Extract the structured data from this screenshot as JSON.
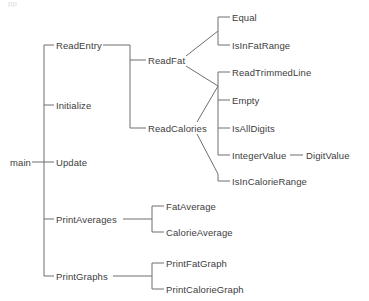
{
  "diagram": {
    "type": "call-tree",
    "title_fragment": "pp",
    "colors": {
      "line": "#6f6f6f",
      "text": "#3d3d3d",
      "background": "#ffffff"
    },
    "root": {
      "label": "main",
      "x": 10,
      "y": 162
    },
    "levels": {
      "level1_spine_x": 44,
      "level2_spine_x": 130,
      "level3_spine_x": 218,
      "averages_spine_x": 152
    },
    "nodes": [
      {
        "id": "main",
        "label": "main",
        "x": 10,
        "y": 162,
        "level": 0
      },
      {
        "id": "ReadEntry",
        "label": "ReadEntry",
        "x": 56,
        "y": 45,
        "level": 1
      },
      {
        "id": "Initialize",
        "label": "Initialize",
        "x": 56,
        "y": 105,
        "level": 1
      },
      {
        "id": "Update",
        "label": "Update",
        "x": 56,
        "y": 162,
        "level": 1
      },
      {
        "id": "PrintAverages",
        "label": "PrintAverages",
        "x": 56,
        "y": 219,
        "level": 1
      },
      {
        "id": "PrintGraphs",
        "label": "PrintGraphs",
        "x": 56,
        "y": 276,
        "level": 1
      },
      {
        "id": "ReadFat",
        "label": "ReadFat",
        "x": 148,
        "y": 60,
        "level": 2
      },
      {
        "id": "ReadCalories",
        "label": "ReadCalories",
        "x": 148,
        "y": 128,
        "level": 2
      },
      {
        "id": "FatAverage",
        "label": "FatAverage",
        "x": 166,
        "y": 206,
        "level": 2
      },
      {
        "id": "CalorieAverage",
        "label": "CalorieAverage",
        "x": 166,
        "y": 232,
        "level": 2
      },
      {
        "id": "PrintFatGraph",
        "label": "PrintFatGraph",
        "x": 166,
        "y": 263,
        "level": 2
      },
      {
        "id": "PrintCalorieGraph",
        "label": "PrintCalorieGraph",
        "x": 166,
        "y": 289,
        "level": 2
      },
      {
        "id": "Equal",
        "label": "Equal",
        "x": 232,
        "y": 17,
        "level": 3
      },
      {
        "id": "IsInFatRange",
        "label": "IsInFatRange",
        "x": 232,
        "y": 45,
        "level": 3
      },
      {
        "id": "ReadTrimmedLine",
        "label": "ReadTrimmedLine",
        "x": 232,
        "y": 72,
        "level": 3
      },
      {
        "id": "Empty",
        "label": "Empty",
        "x": 232,
        "y": 100,
        "level": 3
      },
      {
        "id": "IsAllDigits",
        "label": "IsAllDigits",
        "x": 232,
        "y": 128,
        "level": 3
      },
      {
        "id": "IntegerValue",
        "label": "IntegerValue",
        "x": 232,
        "y": 155,
        "level": 3
      },
      {
        "id": "IsInCalorieRange",
        "label": "IsInCalorieRange",
        "x": 232,
        "y": 181,
        "level": 3
      },
      {
        "id": "DigitValue",
        "label": "DigitValue",
        "x": 306,
        "y": 155,
        "level": 4
      }
    ],
    "edges": [
      {
        "from": "main",
        "to": "ReadEntry"
      },
      {
        "from": "main",
        "to": "Initialize"
      },
      {
        "from": "main",
        "to": "Update"
      },
      {
        "from": "main",
        "to": "PrintAverages"
      },
      {
        "from": "main",
        "to": "PrintGraphs"
      },
      {
        "from": "ReadEntry",
        "to": "ReadFat"
      },
      {
        "from": "ReadEntry",
        "to": "ReadCalories"
      },
      {
        "from": "ReadFat",
        "to": "Equal"
      },
      {
        "from": "ReadFat",
        "to": "IsInFatRange"
      },
      {
        "from": "ReadFat",
        "to": "ReadTrimmedLine"
      },
      {
        "from": "ReadCalories",
        "to": "ReadTrimmedLine"
      },
      {
        "from": "ReadCalories",
        "to": "Empty"
      },
      {
        "from": "ReadCalories",
        "to": "IsAllDigits"
      },
      {
        "from": "ReadCalories",
        "to": "IntegerValue"
      },
      {
        "from": "ReadCalories",
        "to": "IsInCalorieRange"
      },
      {
        "from": "IntegerValue",
        "to": "DigitValue"
      },
      {
        "from": "PrintAverages",
        "to": "FatAverage"
      },
      {
        "from": "PrintAverages",
        "to": "CalorieAverage"
      },
      {
        "from": "PrintGraphs",
        "to": "PrintFatGraph"
      },
      {
        "from": "PrintGraphs",
        "to": "PrintCalorieGraph"
      }
    ]
  }
}
